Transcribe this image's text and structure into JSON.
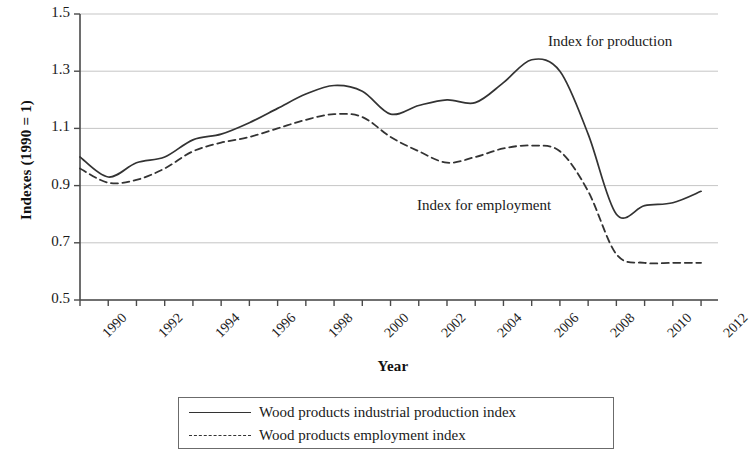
{
  "chart_data": {
    "type": "line",
    "title": "",
    "xlabel": "Year",
    "ylabel": "Indexes (1990 = 1)",
    "xlim": [
      1990,
      2012.6
    ],
    "ylim": [
      0.5,
      1.5
    ],
    "yticks": [
      "0.5",
      "0.7",
      "0.9",
      "1.1",
      "1.3",
      "1.5"
    ],
    "ytick_values": [
      0.5,
      0.7,
      0.9,
      1.1,
      1.3,
      1.5
    ],
    "xticks": [
      "1990",
      "1992",
      "1994",
      "1996",
      "1998",
      "2000",
      "2002",
      "2004",
      "2006",
      "2008",
      "2010",
      "2012"
    ],
    "xtick_values": [
      1990,
      1992,
      1994,
      1996,
      1998,
      2000,
      2002,
      2004,
      2006,
      2008,
      2010,
      2012
    ],
    "grid": "horizontal",
    "legend_position": "below-axes",
    "x": [
      1990,
      1991,
      1992,
      1993,
      1994,
      1995,
      1996,
      1997,
      1998,
      1999,
      2000,
      2001,
      2002,
      2003,
      2004,
      2005,
      2006,
      2007,
      2008,
      2009,
      2010,
      2011,
      2012
    ],
    "series": [
      {
        "name": "Wood products industrial production index",
        "style": "solid",
        "color": "#333333",
        "annotation": "Index for production",
        "values": [
          1.0,
          0.93,
          0.98,
          1.0,
          1.06,
          1.08,
          1.12,
          1.17,
          1.22,
          1.25,
          1.23,
          1.15,
          1.18,
          1.2,
          1.19,
          1.26,
          1.34,
          1.3,
          1.08,
          0.8,
          0.83,
          0.84,
          0.88
        ]
      },
      {
        "name": "Wood products employment index",
        "style": "dashed",
        "color": "#333333",
        "annotation": "Index for employment",
        "values": [
          0.96,
          0.91,
          0.92,
          0.96,
          1.02,
          1.05,
          1.07,
          1.1,
          1.13,
          1.15,
          1.14,
          1.07,
          1.02,
          0.98,
          1.0,
          1.03,
          1.04,
          1.02,
          0.88,
          0.66,
          0.63,
          0.63,
          0.63
        ]
      }
    ]
  },
  "annotations": {
    "production": "Index for production",
    "employment": "Index for employment"
  },
  "legend": {
    "items": [
      {
        "label": "Wood products industrial production index",
        "style": "solid"
      },
      {
        "label": "Wood products employment index",
        "style": "dashed"
      }
    ]
  }
}
